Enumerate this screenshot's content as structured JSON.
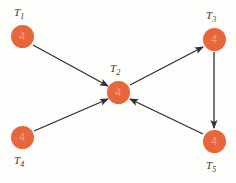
{
  "diagram": {
    "width": 236,
    "height": 183,
    "background_color": "#fdfdfc",
    "node_color": "#e8663c",
    "node_weight_color": "#f2a183",
    "edge_color": "#2f2f2f",
    "label_color": "#3a3a3a",
    "nodes": [
      {
        "id": "T1",
        "label_base": "T",
        "label_sub": "1",
        "weight": "4",
        "cx": 22,
        "cy": 36,
        "label_x": 14,
        "label_y": 6,
        "label_pos": "above"
      },
      {
        "id": "T2",
        "label_base": "T",
        "label_sub": "2",
        "weight": "4",
        "cx": 118,
        "cy": 92,
        "label_x": 110,
        "label_y": 62,
        "label_pos": "above"
      },
      {
        "id": "T3",
        "label_base": "T",
        "label_sub": "3",
        "weight": "4",
        "cx": 214,
        "cy": 39,
        "label_x": 206,
        "label_y": 9,
        "label_pos": "above"
      },
      {
        "id": "T4",
        "label_base": "T",
        "label_sub": "4",
        "weight": "4",
        "cx": 22,
        "cy": 137,
        "label_x": 14,
        "label_y": 154,
        "label_pos": "below"
      },
      {
        "id": "T5",
        "label_base": "T",
        "label_sub": "5",
        "weight": "4",
        "cx": 214,
        "cy": 141,
        "label_x": 206,
        "label_y": 159,
        "label_pos": "below"
      }
    ],
    "edges": [
      {
        "id": "e1",
        "from": "T1",
        "to": "T2",
        "x1": 33,
        "y1": 45,
        "x2": 108,
        "y2": 86
      },
      {
        "id": "e2",
        "from": "T4",
        "to": "T2",
        "x1": 34,
        "y1": 131,
        "x2": 108,
        "y2": 99
      },
      {
        "id": "e3",
        "from": "T2",
        "to": "T3",
        "x1": 130,
        "y1": 85,
        "x2": 203,
        "y2": 47
      },
      {
        "id": "e4",
        "from": "T3",
        "to": "T5",
        "x1": 214,
        "y1": 52,
        "x2": 214,
        "y2": 128
      },
      {
        "id": "e5",
        "from": "T5",
        "to": "T2",
        "x1": 203,
        "y1": 134,
        "x2": 130,
        "y2": 99
      }
    ]
  }
}
